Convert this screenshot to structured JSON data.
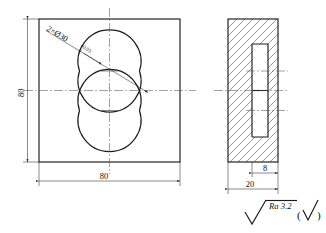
{
  "drawing": {
    "title": "Two-hole plate part drawing",
    "views": {
      "front": {
        "name": "front-view",
        "plate_width_label": "80",
        "plate_height_label": "80",
        "hole_note_prefix": "2×Ø30",
        "hole_tolerance_upper": "+0.03",
        "hole_tolerance_lower": "0",
        "hole_count": 2,
        "hole_diameter": 30,
        "plate_size": 80
      },
      "section": {
        "name": "section-view",
        "thickness_label": "20",
        "pocket_label": "8",
        "thickness": 20,
        "pocket_depth": 8
      }
    },
    "surface_finish": {
      "name": "surface-finish-note",
      "ra_label": "Ra 3.2",
      "open_paren": "(",
      "close_paren": ")",
      "tick_symbol": "√"
    },
    "colors": {
      "outline": "#1a1a1a",
      "thin": "#2b2b2b",
      "center": "#555555",
      "background": "#ffffff"
    }
  }
}
